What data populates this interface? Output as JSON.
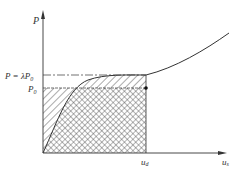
{
  "figure": {
    "y_axis_label": "P",
    "x_axis_label": "u",
    "x_axis_sub": "s",
    "level_high_label": "P = λP",
    "level_high_sub": "0",
    "level_low_label": "P",
    "level_low_sub": "0",
    "marker_label": "u",
    "marker_sub": "d",
    "colors": {
      "line": "#333333",
      "hatch": "#444444",
      "background": "#ffffff"
    }
  }
}
